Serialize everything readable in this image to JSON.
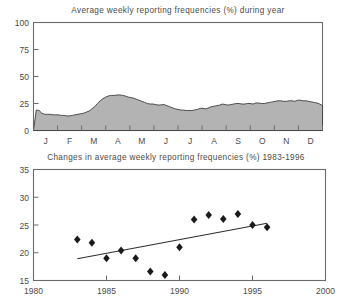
{
  "page": {
    "background": "#ffffff",
    "ink": "#4a4a4a"
  },
  "chart_data": [
    {
      "id": "seasonal-area-chart",
      "type": "area",
      "title": "Average weekly reporting frequencies (%) during year",
      "xlabel": "",
      "ylabel": "",
      "ylim": [
        0,
        100
      ],
      "yticks": [
        0,
        25,
        50,
        75,
        100
      ],
      "ytick_labels": [
        "0",
        "25",
        "50",
        "75",
        "100"
      ],
      "grid": false,
      "legend": "none",
      "fill_color": "#b3b3b3",
      "line_color": "#3d3d3d",
      "categories": [
        "J",
        "F",
        "M",
        "A",
        "M",
        "J",
        "J",
        "A",
        "S",
        "O",
        "N",
        "D"
      ],
      "xtick_labels": [
        "J",
        "F",
        "M",
        "A",
        "M",
        "J",
        "J",
        "A",
        "S",
        "O",
        "N",
        "D"
      ],
      "x": [
        0.0,
        0.5,
        1.0,
        1.5,
        2.0,
        2.5,
        3.0,
        3.5,
        4.0,
        4.5,
        5.0,
        5.5,
        6.0,
        6.5,
        7.0,
        7.5,
        8.0,
        8.5,
        9.0,
        9.5,
        10.0,
        10.5,
        11.0,
        11.5,
        12.0,
        12.5,
        13.0,
        13.5,
        14.0,
        14.5,
        15.0,
        15.5,
        16.0,
        16.5,
        17.0,
        17.5,
        18.0,
        18.5,
        19.0,
        19.5,
        20.0,
        20.5,
        21.0,
        21.5,
        22.0,
        22.5,
        23.0,
        23.5,
        24.0,
        24.5,
        25.0,
        25.5,
        26.0,
        26.5,
        27.0,
        27.5,
        28.0,
        28.5,
        29.0,
        29.5,
        30.0,
        30.5,
        31.0,
        31.5,
        32.0,
        32.5,
        33.0,
        33.5,
        34.0,
        34.5,
        35.0,
        35.5,
        36.0,
        36.5,
        37.0,
        37.5,
        38.0,
        38.5,
        39.0,
        39.5,
        40.0,
        40.5,
        41.0,
        41.5,
        42.0,
        42.5,
        43.0,
        43.5,
        44.0,
        44.5,
        45.0,
        45.5,
        46.0,
        46.5,
        47.0,
        47.5,
        48.0,
        48.5,
        49.0,
        49.5,
        50.0,
        50.5,
        51.0,
        51.5,
        52.0
      ],
      "values": [
        0,
        19,
        18.5,
        16,
        15,
        15,
        15,
        14.5,
        14.5,
        14.5,
        14,
        14,
        13.5,
        13.5,
        14,
        14.5,
        15,
        15.5,
        16,
        17,
        18,
        20,
        22,
        25,
        27.5,
        29.5,
        31,
        32,
        32.5,
        32.5,
        32.8,
        33,
        32.5,
        32,
        31,
        30.5,
        30,
        29,
        28,
        27,
        26,
        25,
        24.5,
        24.5,
        24,
        23.5,
        23.8,
        24,
        23,
        22,
        21,
        20,
        19.5,
        19,
        18.8,
        18.5,
        18.5,
        18.5,
        19,
        19.5,
        20.5,
        20.5,
        20,
        21,
        22,
        22.5,
        23,
        23.5,
        24.5,
        24,
        23.5,
        24,
        24.5,
        25,
        25,
        24.5,
        24.5,
        25,
        25,
        24.5,
        25.5,
        25.5,
        25,
        25,
        25.5,
        26,
        26.5,
        27,
        27.5,
        27.5,
        27,
        27,
        27.5,
        27.5,
        27,
        28,
        28,
        27.5,
        27.5,
        27,
        26.5,
        26,
        25.5,
        24.5,
        23,
        20
      ],
      "note": "seasonal profile by week across the year; peak ~33% in late March / April, trough ~14% in February"
    },
    {
      "id": "annual-trend-scatter",
      "type": "scatter",
      "title": "Changes in average weekly reporting frequencies (%) 1983-1996",
      "xlabel": "",
      "ylabel": "",
      "xlim": [
        1980,
        2000
      ],
      "ylim": [
        15,
        35
      ],
      "xticks": [
        1980,
        1985,
        1990,
        1995,
        2000
      ],
      "xtick_labels": [
        "1980",
        "1985",
        "1990",
        "1995",
        "2000"
      ],
      "yticks": [
        15,
        20,
        25,
        30,
        35
      ],
      "ytick_labels": [
        "15",
        "20",
        "25",
        "30",
        "35"
      ],
      "grid": false,
      "legend": "none",
      "marker": "diamond",
      "marker_color": "#1a1a1a",
      "points": [
        {
          "x": 1983,
          "y": 22.4
        },
        {
          "x": 1984,
          "y": 21.8
        },
        {
          "x": 1985,
          "y": 19.0
        },
        {
          "x": 1986,
          "y": 20.4
        },
        {
          "x": 1987,
          "y": 19.0
        },
        {
          "x": 1988,
          "y": 16.6
        },
        {
          "x": 1989,
          "y": 16.0
        },
        {
          "x": 1990,
          "y": 21.0
        },
        {
          "x": 1991,
          "y": 26.0
        },
        {
          "x": 1992,
          "y": 26.8
        },
        {
          "x": 1993,
          "y": 26.1
        },
        {
          "x": 1994,
          "y": 27.0
        },
        {
          "x": 1995,
          "y": 25.0
        },
        {
          "x": 1996,
          "y": 24.6
        }
      ],
      "trendline": {
        "color": "#2e2e2e",
        "x_start": 1983,
        "y_start": 18.9,
        "x_end": 1996,
        "y_end": 25.3
      }
    }
  ]
}
